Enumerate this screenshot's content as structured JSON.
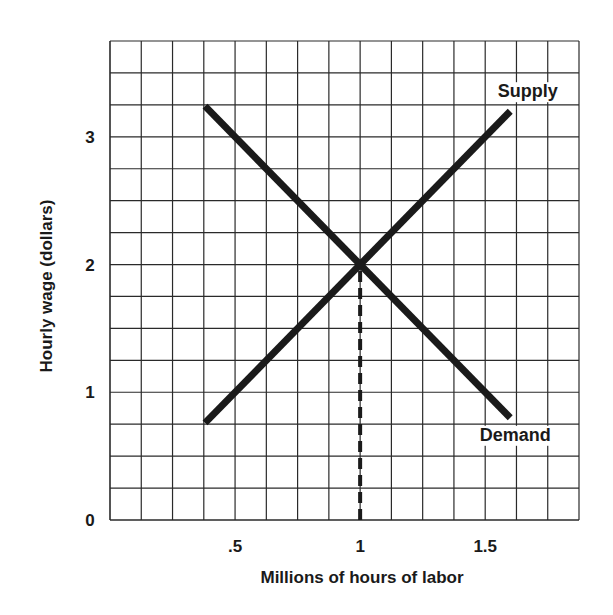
{
  "chart_data": {
    "type": "line",
    "title": "",
    "xlabel": "Millions of hours of labor",
    "ylabel": "Hourly wage (dollars)",
    "xlim": [
      0,
      1.875
    ],
    "ylim": [
      0,
      3.75
    ],
    "grid": true,
    "grid_step_x": 0.125,
    "grid_step_y": 0.25,
    "x_ticks": [
      {
        "value": 0.5,
        "label": ".5"
      },
      {
        "value": 1,
        "label": "1"
      },
      {
        "value": 1.5,
        "label": "1.5"
      }
    ],
    "y_ticks": [
      {
        "value": 0,
        "label": "0"
      },
      {
        "value": 1,
        "label": "1"
      },
      {
        "value": 2,
        "label": "2"
      },
      {
        "value": 3,
        "label": "3"
      }
    ],
    "series": [
      {
        "name": "Supply",
        "x": [
          0.38,
          1.6
        ],
        "y": [
          0.76,
          3.2
        ]
      },
      {
        "name": "Demand",
        "x": [
          0.38,
          1.6
        ],
        "y": [
          3.24,
          0.8
        ]
      }
    ],
    "annotations": [
      {
        "type": "dashed-vertical",
        "x": 1,
        "y_from": 0,
        "y_to": 2,
        "note": "equilibrium quantity"
      },
      {
        "type": "label",
        "text": "Supply",
        "x": 1.67,
        "y": 3.31
      },
      {
        "type": "label",
        "text": "Demand",
        "x": 1.62,
        "y": 0.62
      }
    ],
    "equilibrium": {
      "x": 1,
      "y": 2
    },
    "legend": "inline labels"
  },
  "colors": {
    "line": "#1a1a1a",
    "grid": "#2a2a2a",
    "background": "#ffffff"
  }
}
